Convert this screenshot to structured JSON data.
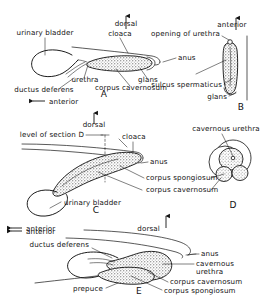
{
  "figure": {
    "panels": [
      {
        "id": "A",
        "letter": "A",
        "labels": [
          "urinary bladder",
          "dorsal",
          "cloaca",
          "anus",
          "glans",
          "corpus cavernosum",
          "urethra",
          "ductus deferens"
        ],
        "orientation": [
          "dorsal",
          "anterior"
        ]
      },
      {
        "id": "B",
        "letter": "B",
        "labels": [
          "anterior",
          "opening of urethra",
          "sulcus spermaticus",
          "glans"
        ],
        "orientation": [
          "anterior"
        ]
      },
      {
        "id": "C",
        "letter": "C",
        "labels": [
          "dorsal",
          "level of section D",
          "cloaca",
          "anus",
          "corpus spongiosum",
          "corpus cavernosum",
          "urinary bladder"
        ],
        "orientation": [
          "dorsal",
          "anterior"
        ]
      },
      {
        "id": "D",
        "letter": "D",
        "labels": [
          "cavernous urethra"
        ]
      },
      {
        "id": "E",
        "letter": "E",
        "labels": [
          "dorsal",
          "anterior",
          "ductus deferens",
          "anus",
          "cavernous urethra",
          "corpus cavernosum",
          "corpus spongiosum",
          "prepuce"
        ],
        "orientation": [
          "dorsal",
          "anterior"
        ]
      }
    ],
    "text": {
      "dorsal_a": "dorsal",
      "urinary_bladder_a": "urinary bladder",
      "cloaca_a": "cloaca",
      "anus_a": "anus",
      "glans_a": "glans",
      "corpus_cavernosum_a": "corpus cavernosum",
      "urethra_a": "urethra",
      "ductus_deferens_a": "ductus deferens",
      "anterior_a": "anterior",
      "letter_a": "A",
      "anterior_b": "anterior",
      "opening_of_urethra_b": "opening of urethra",
      "sulcus_spermaticus_b": "sulcus spermaticus",
      "glans_b": "glans",
      "letter_b": "B",
      "dorsal_c": "dorsal",
      "level_of_section_d_c": "level of section D",
      "cloaca_c": "cloaca",
      "anus_c": "anus",
      "corpus_spongiosum_c": "corpus spongiosum",
      "corpus_cavernosum_c": "corpus cavernosum",
      "urinary_bladder_c": "urinary bladder",
      "anterior_c": "anterior",
      "letter_c": "C",
      "cavernous_urethra_d": "cavernous urethra",
      "letter_d": "D",
      "dorsal_e": "dorsal",
      "anterior_e": "anterior",
      "ductus_deferens_e": "ductus deferens",
      "anus_e": "anus",
      "cavernous_e": "cavernous",
      "urethra_e": "urethra",
      "corpus_cavernosum_e": "corpus cavernosum",
      "corpus_spongiosum_e": "corpus spongiosum",
      "prepuce_e": "prepuce",
      "letter_e": "E"
    },
    "colors": {
      "ink": "#111111",
      "paper": "#ffffff",
      "stipple": "#3a3a3a"
    }
  }
}
